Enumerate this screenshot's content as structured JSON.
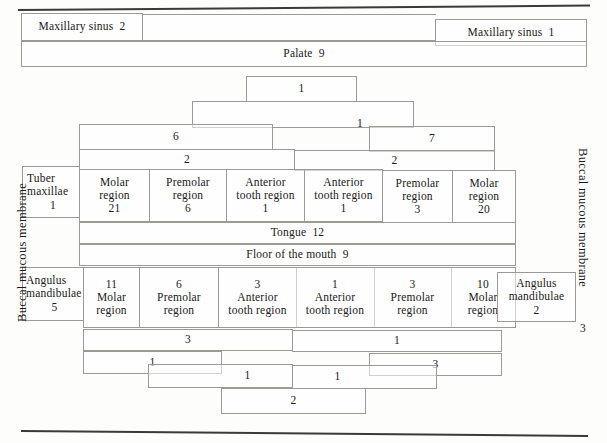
{
  "diagram": {
    "side_labels": {
      "left": "Buccal mucous membrane",
      "right": "Buccal mucous membrane",
      "right_number": "3"
    },
    "maxilla": {
      "sinus_left": {
        "label": "Maxillary sinus",
        "value": "2"
      },
      "sinus_right": {
        "label": "Maxillary sinus",
        "value": "1"
      },
      "palate": {
        "label": "Palate",
        "value": "9"
      },
      "apex": "1",
      "midline": "1",
      "shoulder_left": "6",
      "shoulder_right": "7",
      "band_left": "2",
      "band_right": "2",
      "tuber": {
        "label_line1": "Tuber",
        "label_line2": "maxillae",
        "value": "1"
      },
      "regions": [
        {
          "line1": "Molar",
          "line2": "region",
          "value": "21"
        },
        {
          "line1": "Premolar",
          "line2": "region",
          "value": "6"
        },
        {
          "line1": "Anterior",
          "line2": "tooth region",
          "value": "1"
        },
        {
          "line1": "Anterior",
          "line2": "tooth region",
          "value": "1"
        },
        {
          "line1": "Premolar",
          "line2": "region",
          "value": "3"
        },
        {
          "line1": "Molar",
          "line2": "region",
          "value": "20"
        }
      ]
    },
    "middle": {
      "tongue": {
        "label": "Tongue",
        "value": "12"
      },
      "floor": {
        "label": "Floor of the mouth",
        "value": "9"
      }
    },
    "mandible": {
      "angulus_left": {
        "label_line1": "Angulus",
        "label_line2": "mandibulae",
        "value": "5"
      },
      "angulus_right": {
        "label_line1": "Angulus",
        "label_line2": "mandibulae",
        "value": "2"
      },
      "regions": [
        {
          "value": "11",
          "line1": "Molar",
          "line2": "region"
        },
        {
          "value": "6",
          "line1": "Premolar",
          "line2": "region"
        },
        {
          "value": "3",
          "line1": "Anterior",
          "line2": "tooth region"
        },
        {
          "value": "1",
          "line1": "Anterior",
          "line2": "tooth region"
        },
        {
          "value": "3",
          "line1": "Premolar",
          "line2": "region"
        },
        {
          "value": "10",
          "line1": "Molar",
          "line2": "region"
        }
      ],
      "band_left": "3",
      "band_right": "1",
      "step_left": "1",
      "step_right": "3",
      "inner_left": "1",
      "inner_right": "1",
      "apex": "2"
    }
  }
}
